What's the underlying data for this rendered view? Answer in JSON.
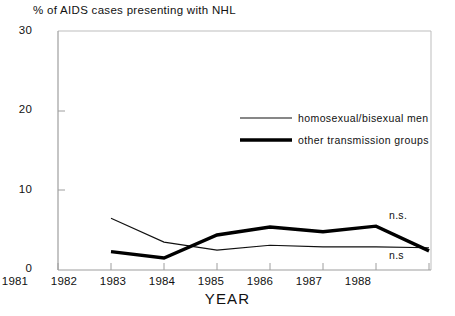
{
  "chart_data": {
    "type": "line",
    "title": "% of AIDS cases presenting with NHL",
    "xlabel": "YEAR",
    "ylabel": "",
    "x": [
      1981,
      1982,
      1983,
      1984,
      1985,
      1986,
      1987,
      1988
    ],
    "xtick_labels": [
      "1981",
      "1982",
      "1983",
      "1984",
      "1985",
      "1986",
      "1987",
      "1988"
    ],
    "ytick_labels": [
      "0",
      "10",
      "20",
      "30"
    ],
    "yticks": [
      0,
      10,
      20,
      30
    ],
    "xlim": [
      1981,
      1988
    ],
    "ylim": [
      0,
      30
    ],
    "grid": false,
    "legend_position": "upper right inside",
    "series": [
      {
        "name": "homosexual/bisexual men",
        "style": "thin",
        "x": [
          1982,
          1983,
          1984,
          1985,
          1986,
          1987,
          1988
        ],
        "values": [
          6.5,
          3.5,
          2.5,
          3.1,
          2.9,
          2.9,
          2.8
        ]
      },
      {
        "name": "other transmission groups",
        "style": "thick",
        "x": [
          1982,
          1983,
          1984,
          1985,
          1986,
          1987,
          1988
        ],
        "values": [
          2.3,
          1.5,
          4.4,
          5.4,
          4.8,
          5.5,
          2.4
        ]
      }
    ],
    "annotations": [
      {
        "text": "n.s.",
        "series": "other transmission groups"
      },
      {
        "text": "n.s",
        "series": "homosexual/bisexual men"
      }
    ]
  },
  "legend": {
    "items": [
      {
        "label": "homosexual/bisexual men"
      },
      {
        "label": "other transmission groups"
      }
    ]
  },
  "axes": {
    "y_labels": [
      "30",
      "20",
      "10",
      "0"
    ],
    "x_labels": [
      "1981",
      "1982",
      "1983",
      "1984",
      "1985",
      "1986",
      "1987",
      "1988"
    ],
    "x_title": "YEAR"
  },
  "annotations": {
    "upper": "n.s.",
    "lower": "n.s"
  },
  "colors": {
    "line": "#000000",
    "frame": "#b9b9b9",
    "text": "#111111",
    "background": "#ffffff"
  }
}
